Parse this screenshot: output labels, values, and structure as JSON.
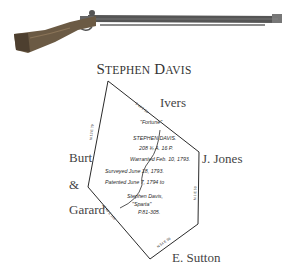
{
  "image": {
    "subject": "rifle-photo"
  },
  "title": {
    "first_initial": "S",
    "first_rest": "TEPHEN",
    "last_initial": "D",
    "last_rest": "AVIS",
    "full": "Stephen Davis"
  },
  "neighbors": {
    "north": "Ivers",
    "east": "J. Jones",
    "west_1": "Burt",
    "west_2": "&",
    "west_3": "Garard",
    "south": "E. Sutton"
  },
  "plat": {
    "tract_name": "\"Fortune\"",
    "owner": "STEPHEN DAVIS.",
    "acreage": "208 ¾ A. 16 P.",
    "warrant": "Warranted Feb. 10, 1793.",
    "surveyed": "Surveyed June 18, 1793.",
    "patented": "Patented June 7, 1794 to",
    "adjoining_owner": "Stephen Davis,",
    "adjoining_tract": "\"Sparta\"",
    "patent_ref": "P.81-305."
  },
  "colors": {
    "ink": "#2a2a2a",
    "label": "#444444",
    "rifle_wood": "#6b5a44",
    "rifle_metal": "#4a4a4a"
  }
}
